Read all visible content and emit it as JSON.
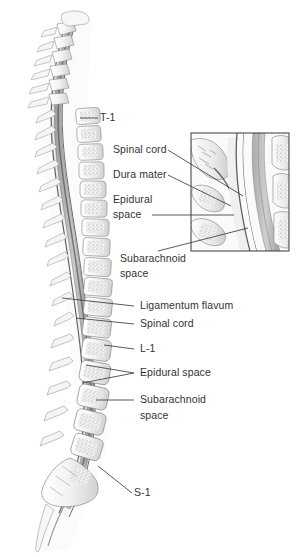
{
  "figure": {
    "kind": "anatomical-illustration",
    "style": "grayscale medical line drawing with stippled trabecular bone",
    "background_color": "#ffffff",
    "text_color": "#333333",
    "line_color": "#3c3c3c",
    "bone_fill": "#f2f2f2",
    "bone_shade": "#d6d6d6",
    "cord_color": "#8d8d8d",
    "dura_color": "#6a6a6a"
  },
  "labels": {
    "t1": "T-1",
    "l1": "L-1",
    "s1": "S-1",
    "spinal_cord_inset": "Spinal cord",
    "dura_mater": "Dura mater",
    "epidural_space_inset_line1": "Epidural",
    "epidural_space_inset_line2": "space",
    "subarachnoid_space_inset_line1": "Subarachnoid",
    "subarachnoid_space_inset_line2": "space",
    "ligamentum_flavum": "Ligamentum flavum",
    "spinal_cord_lower": "Spinal cord",
    "epidural_space_lower": "Epidural space",
    "subarachnoid_space_lower_line1": "Subarachnoid",
    "subarachnoid_space_lower_line2": "space"
  },
  "inset": {
    "name": "magnified-detail-box",
    "x": 191,
    "y": 133,
    "width": 98,
    "height": 118,
    "border_color": "#4a4a4a"
  }
}
